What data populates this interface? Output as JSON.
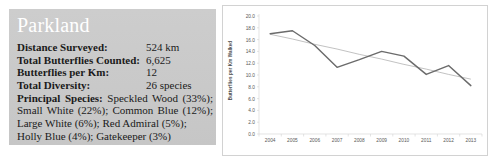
{
  "info_panel": {
    "title": "Parkland",
    "stats": [
      {
        "label": "Distance Surveyed:",
        "value": "524 km"
      },
      {
        "label": "Total Butterflies Counted:",
        "value": "6,625"
      },
      {
        "label": "Butterflies per Km:",
        "value": "12"
      },
      {
        "label": "Total Diversity:",
        "value": "26 species"
      }
    ],
    "species_heading": "Principal Species:",
    "species_lines": [
      "Speckled Wood (33%);",
      "Small White (22%); Common Blue (12%);",
      "Large White (6%); Red Admiral (5%);",
      "Holly Blue (4%); Gatekeeper (3%)"
    ]
  },
  "chart_data": {
    "type": "line",
    "title": "",
    "xlabel": "",
    "ylabel": "Butterflies per Km Walked",
    "x": [
      "2004",
      "2005",
      "2006",
      "2007",
      "2008",
      "2009",
      "2010",
      "2011",
      "2012",
      "2013"
    ],
    "categories": [
      "2004",
      "2005",
      "2006",
      "2007",
      "2008",
      "2009",
      "2010",
      "2011",
      "2012",
      "2013"
    ],
    "ylim": [
      0.0,
      20.0
    ],
    "y_ticks": [
      "0.0",
      "2.0",
      "4.0",
      "6.0",
      "8.0",
      "10.0",
      "12.0",
      "14.0",
      "16.0",
      "18.0",
      "20.0"
    ],
    "grid": false,
    "legend": "none",
    "series": [
      {
        "name": "Butterflies per Km Walked",
        "values": [
          17.0,
          17.5,
          15.0,
          11.3,
          12.6,
          14.0,
          13.2,
          10.1,
          11.6,
          8.2
        ],
        "color": "#6b6b6b"
      },
      {
        "name": "Linear trend",
        "type": "trendline",
        "values": [
          16.9,
          16.1,
          15.2,
          14.4,
          13.5,
          12.7,
          11.8,
          11.0,
          10.1,
          9.3
        ],
        "color": "#a8a8a8"
      }
    ]
  }
}
